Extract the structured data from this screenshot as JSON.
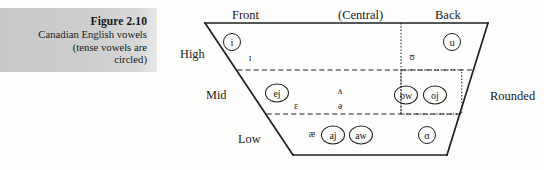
{
  "caption": {
    "title": "Figure 2.10",
    "line1": "Canadian English vowels",
    "line2": "(tense vowels are",
    "line3": "circled)"
  },
  "chart": {
    "column_headers": [
      {
        "label": "Front",
        "x": 62,
        "y": 9
      },
      {
        "label": "(Central)",
        "x": 168,
        "y": 9
      },
      {
        "label": "Back",
        "x": 265,
        "y": 9
      }
    ],
    "row_labels": [
      {
        "label": "High",
        "x": 10,
        "y": 48
      },
      {
        "label": "Mid",
        "x": 36,
        "y": 89
      },
      {
        "label": "Low",
        "x": 68,
        "y": 133
      }
    ],
    "side_labels": [
      {
        "label": "Rounded",
        "x": 320,
        "y": 90
      }
    ],
    "vowels": [
      {
        "symbol": "i",
        "x": 62,
        "y": 42,
        "circled": true,
        "wide": false,
        "small": false,
        "name": "vowel-i"
      },
      {
        "symbol": "ɪ",
        "x": 80,
        "y": 58,
        "circled": false,
        "wide": false,
        "small": true,
        "name": "vowel-small-cap-i"
      },
      {
        "symbol": "ʊ",
        "x": 242,
        "y": 57,
        "circled": false,
        "wide": false,
        "small": true,
        "name": "vowel-upsilon"
      },
      {
        "symbol": "u",
        "x": 282,
        "y": 42,
        "circled": true,
        "wide": false,
        "small": false,
        "name": "vowel-u"
      },
      {
        "symbol": "ej",
        "x": 107,
        "y": 93,
        "circled": true,
        "wide": true,
        "small": false,
        "name": "vowel-ej"
      },
      {
        "symbol": "ɛ",
        "x": 126,
        "y": 106,
        "circled": false,
        "wide": false,
        "small": true,
        "name": "vowel-epsilon"
      },
      {
        "symbol": "ʌ",
        "x": 170,
        "y": 91,
        "circled": false,
        "wide": false,
        "small": true,
        "name": "vowel-caret"
      },
      {
        "symbol": "ə",
        "x": 170,
        "y": 106,
        "circled": false,
        "wide": false,
        "small": true,
        "name": "vowel-schwa"
      },
      {
        "symbol": "ow",
        "x": 236,
        "y": 95,
        "circled": true,
        "wide": true,
        "small": false,
        "name": "vowel-ow"
      },
      {
        "symbol": "oj",
        "x": 265,
        "y": 95,
        "circled": true,
        "wide": true,
        "small": false,
        "name": "vowel-oj"
      },
      {
        "symbol": "æ",
        "x": 142,
        "y": 134,
        "circled": false,
        "wide": false,
        "small": true,
        "name": "vowel-ash"
      },
      {
        "symbol": "aj",
        "x": 163,
        "y": 135,
        "circled": true,
        "wide": true,
        "small": false,
        "name": "vowel-aj"
      },
      {
        "symbol": "aw",
        "x": 191,
        "y": 135,
        "circled": true,
        "wide": true,
        "small": false,
        "name": "vowel-aw"
      },
      {
        "symbol": "ɑ",
        "x": 257,
        "y": 135,
        "circled": true,
        "wide": false,
        "small": false,
        "name": "vowel-script-a"
      }
    ],
    "geometry": {
      "top_left_x": 35,
      "top_y": 23,
      "top_right_x": 318,
      "bottom_left_x": 123,
      "bottom_y": 155,
      "bottom_right_x": 277,
      "high_mid_y": 70,
      "mid_low_y": 114,
      "central_divider_x": 231
    },
    "colors": {
      "line": "#1d1f21",
      "caption_bg": "#cccccc",
      "page_bg": "#fdfdfb"
    }
  }
}
